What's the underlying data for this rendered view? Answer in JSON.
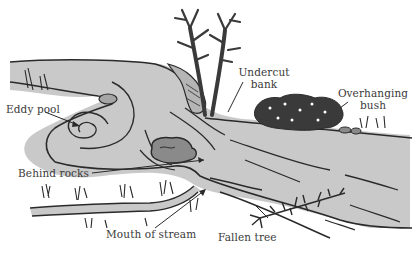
{
  "diagram": {
    "colors": {
      "water": "#c9c9c9",
      "ink": "#2a2a2a",
      "rock": "#8a8a8a",
      "rock_light": "#a5a5a5",
      "bush": "#3a3a3a",
      "background": "#ffffff"
    },
    "labels": [
      {
        "id": "eddy_pool",
        "text": "Eddy pool"
      },
      {
        "id": "undercut_bank_line1",
        "text": "Undercut"
      },
      {
        "id": "undercut_bank_line2",
        "text": "bank"
      },
      {
        "id": "overhanging_bush_line1",
        "text": "Overhanging"
      },
      {
        "id": "overhanging_bush_line2",
        "text": "bush"
      },
      {
        "id": "behind_rocks",
        "text": "Behind rocks"
      },
      {
        "id": "mouth_of_stream",
        "text": "Mouth of stream"
      },
      {
        "id": "fallen_tree",
        "text": "Fallen tree"
      }
    ]
  }
}
